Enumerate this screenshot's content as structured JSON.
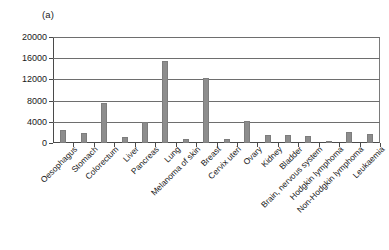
{
  "panel": {
    "label": "(a)"
  },
  "chart_data": {
    "type": "bar",
    "title": "",
    "subtitle": "",
    "xlabel": "",
    "ylabel": "",
    "ylim": [
      0,
      20000
    ],
    "ytick_values": [
      0,
      4000,
      8000,
      12000,
      16000,
      20000
    ],
    "ytick_labels": [
      "0",
      "4000",
      "8000",
      "12000",
      "16000",
      "20000"
    ],
    "grid": true,
    "legend": "none",
    "bar_color": "#8d8d8d",
    "categories": [
      "Oesophagus",
      "Stomach",
      "Colorectum",
      "Liver",
      "Pancreas",
      "Lung",
      "Melanoma of skin",
      "Breast",
      "Cervix uteri",
      "Ovary",
      "Kidney",
      "Bladder",
      "Brain, nervous system",
      "Hodgkin lymphoma",
      "Non-Hodgkin lymphoma",
      "Leukaemia"
    ],
    "values": [
      2500,
      1800,
      7600,
      1200,
      4000,
      15500,
      700,
      12200,
      800,
      4200,
      1450,
      1500,
      1350,
      150,
      2050,
      1750
    ]
  }
}
